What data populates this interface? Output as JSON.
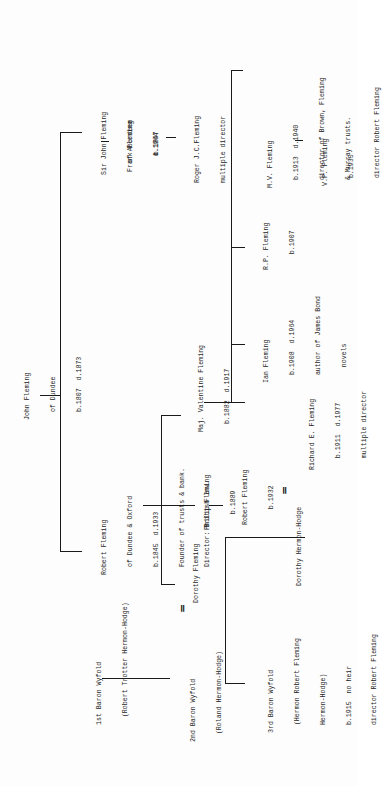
{
  "people": {
    "john_fleming": {
      "lines": [
        "John Fleming",
        "  of Dundee",
        "  b.1807  d.1873"
      ]
    },
    "sir_john_fleming": {
      "lines": [
        "Sir John Fleming",
        "   of Aberdeen",
        "     b.1847"
      ]
    },
    "frank_fleming": {
      "lines": [
        "Frank Fleming",
        "    d.1964"
      ]
    },
    "roger_fleming": {
      "lines": [
        "Roger J.C.Fleming",
        "multiple director"
      ]
    },
    "robert_fleming_1845": {
      "lines": [
        "Robert Fleming",
        "  of Dundee & Oxford",
        "  b.1845  d.1933",
        "  Founder of trusts & bank.",
        "  Director: British Inv."
      ]
    },
    "valentine_fleming": {
      "lines": [
        "Maj. Valentine Fleming",
        "  b.1882  d.1917"
      ]
    },
    "philip_fleming": {
      "lines": [
        "Philip Fleming",
        "    b.1889"
      ]
    },
    "dorothy_fleming": {
      "lines": [
        "Dorothy Fleming"
      ]
    },
    "robert_fleming_1932": {
      "lines": [
        "Robert Fleming",
        "    b.1932"
      ]
    },
    "ian_fleming": {
      "lines": [
        "Ian Fleming",
        "  b.1908  d.1964",
        "  author of James Bond",
        "    novels"
      ]
    },
    "rp_fleming": {
      "lines": [
        "R.P. Fleming",
        "    b.1907"
      ]
    },
    "mv_fleming": {
      "lines": [
        "M.V. Fleming",
        "  b.1913  d.1940",
        "  director of Brown, Fleming",
        "  & Murray trusts."
      ]
    },
    "vp_fleming": {
      "lines": [
        "V.P. Fleming",
        "  b.1935",
        "  director Robert Fleming"
      ]
    },
    "richard_fleming": {
      "lines": [
        "Richard E. Fleming",
        "   b.1911  d.1977",
        "   multiple director"
      ]
    },
    "dorothy_hermon_hodge": {
      "lines": [
        "Dorothy Hermon-Hodge"
      ]
    },
    "baron_wyfold_1": {
      "lines": [
        "1st Baron Wyfold",
        "  (Robert Trotter Hermon-Hodge)"
      ]
    },
    "baron_wyfold_2": {
      "lines": [
        "2nd Baron Wyfold",
        "  (Roland Hermon-Hodge)"
      ]
    },
    "baron_wyfold_3": {
      "lines": [
        "3rd Baron Wyfold",
        "  (Hermon Robert Fleming",
        "  Hermon-Hodge)",
        "  b.1915  no heir",
        "  director Robert Fleming"
      ]
    }
  },
  "marriage_symbol": "="
}
